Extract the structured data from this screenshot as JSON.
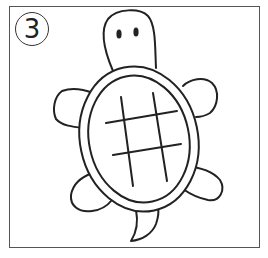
{
  "step": {
    "number": "3"
  },
  "illustration": {
    "subject": "turtle",
    "stroke_color": "#222222",
    "frame_color": "#555555",
    "background": "#ffffff",
    "parts": [
      "head",
      "eyes",
      "shell-outer",
      "shell-inner",
      "shell-grid",
      "front-left-flipper",
      "front-right-flipper",
      "back-left-flipper",
      "back-right-flipper",
      "tail"
    ]
  }
}
